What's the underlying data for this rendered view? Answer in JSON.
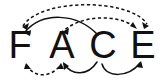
{
  "figure": {
    "background_color": "#ffffff",
    "stroke_color": "#111111",
    "width": 163,
    "height": 82
  },
  "letters": [
    {
      "id": "F",
      "label": "F",
      "x": 20,
      "y": 58
    },
    {
      "id": "A",
      "label": "A",
      "x": 62,
      "y": 58
    },
    {
      "id": "C",
      "label": "C",
      "x": 103,
      "y": 58
    },
    {
      "id": "E",
      "label": "E",
      "x": 143,
      "y": 58
    }
  ],
  "arcs": [
    {
      "id": "arc-dashed-top-long",
      "style": "dashed",
      "position": "above",
      "from": "E",
      "to": "F",
      "direction": "bidirectional",
      "path": "M 23 26 C 40 -2 130 -2 147 24",
      "arrowheads": [
        {
          "at": "F",
          "x": 22,
          "y": 27,
          "angle": 236
        },
        {
          "at": "E",
          "x": 148,
          "y": 25,
          "angle": 56
        }
      ]
    },
    {
      "id": "arc-dashed-top-short",
      "style": "dashed",
      "position": "above",
      "from": "A",
      "to": "E",
      "direction": "forward",
      "path": "M 61 33 C 80 14 118 14 135 27",
      "arrowheads": [
        {
          "at": "E",
          "x": 136,
          "y": 28,
          "angle": 40
        }
      ]
    },
    {
      "id": "arc-solid-top",
      "style": "solid",
      "position": "above",
      "from": "C",
      "to": "F",
      "direction": "bidirectional",
      "path": "M 25 32 C 42 12 76 12 98 35",
      "arrowheads": [
        {
          "at": "F",
          "x": 24,
          "y": 33,
          "angle": 230
        },
        {
          "at": "A",
          "x": 63,
          "y": 31,
          "angle": 220
        }
      ]
    },
    {
      "id": "arc-dashed-bottom",
      "style": "dashed",
      "position": "below",
      "from": "F",
      "to": "A",
      "direction": "bidirectional",
      "path": "M 27 65 C 33 78 52 78 60 65",
      "arrowheads": [
        {
          "at": "F",
          "x": 26,
          "y": 64,
          "angle": 295
        },
        {
          "at": "A",
          "x": 61,
          "y": 64,
          "angle": 245
        }
      ]
    },
    {
      "id": "arc-solid-bottom-left",
      "style": "solid",
      "position": "below",
      "from": "C",
      "to": "A",
      "direction": "forward",
      "path": "M 97 62 C 88 76 72 76 64 64",
      "arrowheads": [
        {
          "at": "A",
          "x": 63,
          "y": 63,
          "angle": 237
        }
      ]
    },
    {
      "id": "arc-solid-bottom-right",
      "style": "solid",
      "position": "below",
      "from": "C",
      "to": "E",
      "direction": "forward",
      "path": "M 102 64 C 106 78 128 78 140 63",
      "arrowheads": [
        {
          "at": "E",
          "x": 141,
          "y": 62,
          "angle": 310
        }
      ]
    }
  ]
}
